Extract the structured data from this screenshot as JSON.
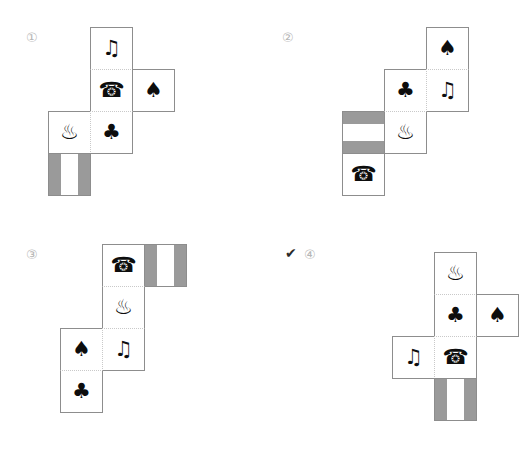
{
  "page": {
    "background": "#ffffff",
    "grid_color": "#8d8d8d",
    "seam_color": "#c9c9c9",
    "stripe_color": "#9a9a9a",
    "glyph_color": "#0d0d0d",
    "label_color": "#b6b6b6",
    "cell_size": 43,
    "type": "cube-net-multiple-choice"
  },
  "glyphs": {
    "note": "♫",
    "phone": "☎",
    "spade": "♠",
    "club": "♣",
    "onsen": "♨",
    "check": "✔"
  },
  "options": [
    {
      "id": "option-1",
      "label": "①",
      "label_x": 26,
      "label_y": 31,
      "selected": false,
      "origin_x": 48,
      "origin_y": 27,
      "cells": [
        {
          "name": "face-note",
          "col": 1,
          "row": 0,
          "icon": "note",
          "glyph_class": "g-note",
          "striped": false,
          "stripe_dir": "",
          "seam_top": false,
          "seam_left": false
        },
        {
          "name": "face-phone",
          "col": 1,
          "row": 1,
          "icon": "phone",
          "glyph_class": "g-phone",
          "striped": false,
          "stripe_dir": "",
          "seam_top": true,
          "seam_left": false
        },
        {
          "name": "face-spade",
          "col": 2,
          "row": 1,
          "icon": "spade",
          "glyph_class": "g-spade",
          "striped": false,
          "stripe_dir": "",
          "seam_top": false,
          "seam_left": false
        },
        {
          "name": "face-onsen",
          "col": 0,
          "row": 2,
          "icon": "onsen",
          "glyph_class": "g-onsen",
          "striped": false,
          "stripe_dir": "",
          "seam_top": false,
          "seam_left": false
        },
        {
          "name": "face-club",
          "col": 1,
          "row": 2,
          "icon": "club",
          "glyph_class": "g-club",
          "striped": false,
          "stripe_dir": "",
          "seam_top": true,
          "seam_left": true
        },
        {
          "name": "face-striped",
          "col": 0,
          "row": 3,
          "icon": "",
          "glyph_class": "",
          "striped": true,
          "stripe_dir": "v",
          "seam_top": false,
          "seam_left": false
        }
      ]
    },
    {
      "id": "option-2",
      "label": "②",
      "label_x": 282,
      "label_y": 31,
      "selected": false,
      "origin_x": 342,
      "origin_y": 27,
      "cells": [
        {
          "name": "face-spade",
          "col": 2,
          "row": 0,
          "icon": "spade",
          "glyph_class": "g-spade",
          "striped": false,
          "stripe_dir": "",
          "seam_top": false,
          "seam_left": false
        },
        {
          "name": "face-club",
          "col": 1,
          "row": 1,
          "icon": "club",
          "glyph_class": "g-club",
          "striped": false,
          "stripe_dir": "",
          "seam_top": false,
          "seam_left": false
        },
        {
          "name": "face-note",
          "col": 2,
          "row": 1,
          "icon": "note",
          "glyph_class": "g-note",
          "striped": false,
          "stripe_dir": "",
          "seam_top": true,
          "seam_left": true
        },
        {
          "name": "face-striped",
          "col": 0,
          "row": 2,
          "icon": "",
          "glyph_class": "",
          "striped": true,
          "stripe_dir": "h",
          "seam_top": false,
          "seam_left": false
        },
        {
          "name": "face-onsen",
          "col": 1,
          "row": 2,
          "icon": "onsen",
          "glyph_class": "g-onsen",
          "striped": false,
          "stripe_dir": "",
          "seam_top": true,
          "seam_left": false
        },
        {
          "name": "face-phone",
          "col": 0,
          "row": 3,
          "icon": "phone",
          "glyph_class": "g-phone",
          "striped": false,
          "stripe_dir": "",
          "seam_top": false,
          "seam_left": false
        }
      ]
    },
    {
      "id": "option-3",
      "label": "③",
      "label_x": 26,
      "label_y": 248,
      "selected": false,
      "origin_x": 60,
      "origin_y": 244,
      "cells": [
        {
          "name": "face-phone",
          "col": 1,
          "row": 0,
          "icon": "phone",
          "glyph_class": "g-phone",
          "striped": false,
          "stripe_dir": "",
          "seam_top": false,
          "seam_left": false
        },
        {
          "name": "face-striped",
          "col": 2,
          "row": 0,
          "icon": "",
          "glyph_class": "",
          "striped": true,
          "stripe_dir": "v",
          "seam_top": false,
          "seam_left": false
        },
        {
          "name": "face-onsen",
          "col": 1,
          "row": 1,
          "icon": "onsen",
          "glyph_class": "g-onsen",
          "striped": false,
          "stripe_dir": "",
          "seam_top": true,
          "seam_left": false
        },
        {
          "name": "face-spade",
          "col": 0,
          "row": 2,
          "icon": "spade",
          "glyph_class": "g-spade",
          "striped": false,
          "stripe_dir": "",
          "seam_top": false,
          "seam_left": false
        },
        {
          "name": "face-note",
          "col": 1,
          "row": 2,
          "icon": "note",
          "glyph_class": "g-note",
          "striped": false,
          "stripe_dir": "",
          "seam_top": true,
          "seam_left": true
        },
        {
          "name": "face-club",
          "col": 0,
          "row": 3,
          "icon": "club",
          "glyph_class": "g-club",
          "striped": false,
          "stripe_dir": "",
          "seam_top": true,
          "seam_left": false
        }
      ]
    },
    {
      "id": "option-4",
      "label": "④",
      "label_x": 304,
      "label_y": 248,
      "selected": true,
      "check_x": 285,
      "check_y": 246,
      "origin_x": 392,
      "origin_y": 252,
      "cells": [
        {
          "name": "face-onsen",
          "col": 1,
          "row": 0,
          "icon": "onsen",
          "glyph_class": "g-onsen",
          "striped": false,
          "stripe_dir": "",
          "seam_top": false,
          "seam_left": false
        },
        {
          "name": "face-club",
          "col": 1,
          "row": 1,
          "icon": "club",
          "glyph_class": "g-club",
          "striped": false,
          "stripe_dir": "",
          "seam_top": true,
          "seam_left": false
        },
        {
          "name": "face-spade",
          "col": 2,
          "row": 1,
          "icon": "spade",
          "glyph_class": "g-spade",
          "striped": false,
          "stripe_dir": "",
          "seam_top": false,
          "seam_left": false
        },
        {
          "name": "face-note",
          "col": 0,
          "row": 2,
          "icon": "note",
          "glyph_class": "g-note",
          "striped": false,
          "stripe_dir": "",
          "seam_top": false,
          "seam_left": false
        },
        {
          "name": "face-phone",
          "col": 1,
          "row": 2,
          "icon": "phone",
          "glyph_class": "g-phone",
          "striped": false,
          "stripe_dir": "",
          "seam_top": true,
          "seam_left": true
        },
        {
          "name": "face-striped",
          "col": 1,
          "row": 3,
          "icon": "",
          "glyph_class": "",
          "striped": true,
          "stripe_dir": "v",
          "seam_top": false,
          "seam_left": false
        }
      ]
    }
  ]
}
